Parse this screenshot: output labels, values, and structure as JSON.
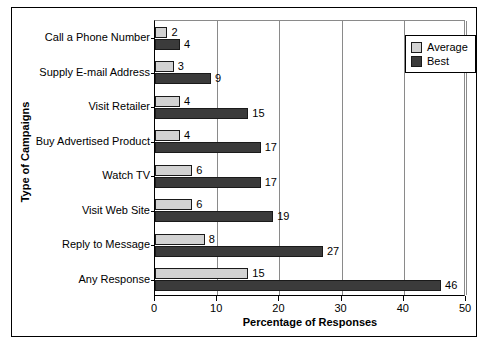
{
  "chart_data": {
    "type": "bar",
    "orientation": "horizontal",
    "title": "",
    "xlabel": "Percentage of Responses",
    "ylabel": "Type of Campaigns",
    "xlim": [
      0,
      50
    ],
    "xticks": [
      0,
      10,
      20,
      30,
      40,
      50
    ],
    "grid": "vertical",
    "legend_position": "top-right",
    "categories": [
      "Call a Phone Number",
      "Supply E-mail Address",
      "Visit Retailer",
      "Buy Advertised Product",
      "Watch TV",
      "Visit Web Site",
      "Reply to Message",
      "Any Response"
    ],
    "series": [
      {
        "name": "Average",
        "color": "#d2d2d2",
        "values": [
          2,
          3,
          4,
          4,
          6,
          6,
          8,
          15
        ]
      },
      {
        "name": "Best",
        "color": "#3b3b3b",
        "values": [
          4,
          9,
          15,
          17,
          17,
          19,
          27,
          46
        ]
      }
    ]
  },
  "legend": {
    "items": [
      {
        "label": "Average"
      },
      {
        "label": "Best"
      }
    ]
  }
}
